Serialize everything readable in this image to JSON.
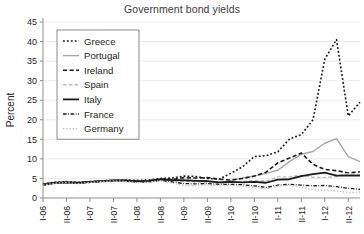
{
  "chart_data": {
    "type": "line",
    "title": "Government bond yields",
    "xlabel": "",
    "ylabel": "Percent",
    "ylim": [
      0,
      45
    ],
    "ytick_step": 5,
    "yticks": [
      0,
      5,
      10,
      15,
      20,
      25,
      30,
      35,
      40,
      45
    ],
    "grid": "horizontal",
    "legend_position": "top-left",
    "xticks": [
      "I-06",
      "II-06",
      "I-07",
      "II-07",
      "I-08",
      "II-08",
      "I-09",
      "II-09",
      "I-10",
      "II-10",
      "I-11",
      "II-11",
      "I-12",
      "II-12"
    ],
    "x": [
      "2006-01",
      "2006-04",
      "2006-07",
      "2006-10",
      "2007-01",
      "2007-04",
      "2007-07",
      "2007-10",
      "2008-01",
      "2008-04",
      "2008-07",
      "2008-10",
      "2009-01",
      "2009-04",
      "2009-07",
      "2009-10",
      "2010-01",
      "2010-04",
      "2010-07",
      "2010-10",
      "2011-01",
      "2011-04",
      "2011-07",
      "2011-10",
      "2012-01",
      "2012-04",
      "2012-07",
      "2012-10"
    ],
    "series": [
      {
        "name": "Greece",
        "color": "#1a1a1a",
        "style": "dotted",
        "width": 1.6,
        "values": [
          3.6,
          4.0,
          4.2,
          4.0,
          4.2,
          4.4,
          4.5,
          4.6,
          4.5,
          4.6,
          5.0,
          5.1,
          5.6,
          5.5,
          5.0,
          4.8,
          6.3,
          8.0,
          10.6,
          10.8,
          11.8,
          15.1,
          16.2,
          20.0,
          35.5,
          40.5,
          21.0,
          24.5
        ]
      },
      {
        "name": "Portugal",
        "color": "#a8a8a8",
        "style": "solid",
        "width": 1.4,
        "values": [
          3.4,
          3.9,
          4.0,
          3.9,
          4.1,
          4.3,
          4.5,
          4.5,
          4.4,
          4.4,
          4.8,
          4.6,
          4.6,
          4.5,
          4.3,
          4.0,
          4.4,
          5.1,
          5.6,
          6.3,
          7.1,
          9.3,
          11.2,
          11.9,
          14.0,
          15.2,
          10.6,
          9.3
        ]
      },
      {
        "name": "Ireland",
        "color": "#1a1a1a",
        "style": "dashed",
        "width": 1.6,
        "values": [
          3.4,
          3.9,
          4.0,
          3.8,
          4.1,
          4.3,
          4.5,
          4.4,
          4.3,
          4.4,
          4.8,
          4.7,
          5.2,
          5.1,
          5.2,
          4.8,
          4.6,
          5.0,
          5.6,
          6.6,
          9.0,
          10.2,
          11.5,
          8.6,
          7.3,
          7.0,
          6.4,
          6.7
        ]
      },
      {
        "name": "Spain",
        "color": "#bdbdbd",
        "style": "dashed",
        "width": 1.4,
        "values": [
          3.4,
          3.8,
          3.9,
          3.8,
          4.0,
          4.2,
          4.4,
          4.4,
          4.2,
          4.3,
          4.7,
          4.4,
          4.3,
          4.1,
          4.0,
          3.8,
          3.9,
          4.2,
          4.5,
          4.3,
          5.4,
          5.4,
          5.8,
          5.3,
          5.2,
          5.5,
          6.3,
          6.0
        ]
      },
      {
        "name": "Italy",
        "color": "#1a1a1a",
        "style": "solid",
        "width": 1.8,
        "values": [
          3.4,
          3.9,
          4.0,
          3.9,
          4.1,
          4.3,
          4.5,
          4.5,
          4.3,
          4.4,
          4.8,
          4.6,
          4.5,
          4.4,
          4.3,
          4.0,
          4.1,
          4.0,
          4.1,
          3.9,
          4.7,
          4.8,
          5.6,
          6.1,
          6.5,
          5.7,
          5.8,
          5.7
        ]
      },
      {
        "name": "France",
        "color": "#1a1a1a",
        "style": "dashdot",
        "width": 1.3,
        "values": [
          3.3,
          3.8,
          3.9,
          3.7,
          4.0,
          4.2,
          4.4,
          4.3,
          4.0,
          4.1,
          4.5,
          4.1,
          3.7,
          3.6,
          3.7,
          3.5,
          3.5,
          3.4,
          3.1,
          2.7,
          3.3,
          3.5,
          3.3,
          3.1,
          3.2,
          2.9,
          2.5,
          2.2
        ]
      },
      {
        "name": "Germany",
        "color": "#c6c6c6",
        "style": "dotted",
        "width": 1.3,
        "values": [
          3.3,
          3.8,
          3.9,
          3.7,
          4.0,
          4.2,
          4.4,
          4.2,
          3.9,
          4.0,
          4.4,
          3.8,
          3.2,
          3.2,
          3.3,
          3.2,
          3.2,
          3.0,
          2.6,
          2.3,
          3.0,
          3.3,
          2.7,
          2.1,
          2.0,
          1.8,
          1.4,
          1.5
        ]
      }
    ]
  }
}
